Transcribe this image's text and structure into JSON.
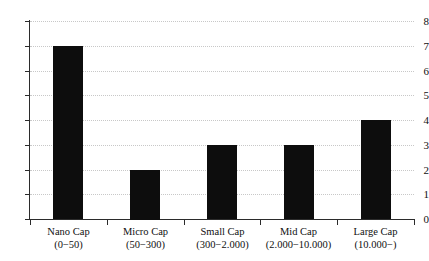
{
  "chart_data": {
    "type": "bar",
    "title": "",
    "subtitle": "",
    "xlabel": "",
    "ylabel": "",
    "categories": [
      "Nano Cap",
      "Micro Cap",
      "Small Cap",
      "Mid Cap",
      "Large Cap"
    ],
    "category_ranges": [
      "(0−50)",
      "(50−300)",
      "(300−2.000)",
      "(2.000−10.000)",
      "(10.000−)"
    ],
    "values": [
      7,
      2,
      3,
      3,
      4
    ],
    "ylim": [
      0,
      8
    ],
    "ytick_labels": [
      "0",
      "1",
      "2",
      "3",
      "4",
      "5",
      "6",
      "7",
      "8"
    ],
    "ytick_values": [
      0,
      1,
      2,
      3,
      4,
      5,
      6,
      7,
      8
    ],
    "grid": "horizontal-dotted",
    "legend": "none",
    "bar_color": "#0d0d0d",
    "grid_color": "#c8c8c8",
    "axis_color": "#2b2b2b",
    "background_color": "#ffffff"
  }
}
